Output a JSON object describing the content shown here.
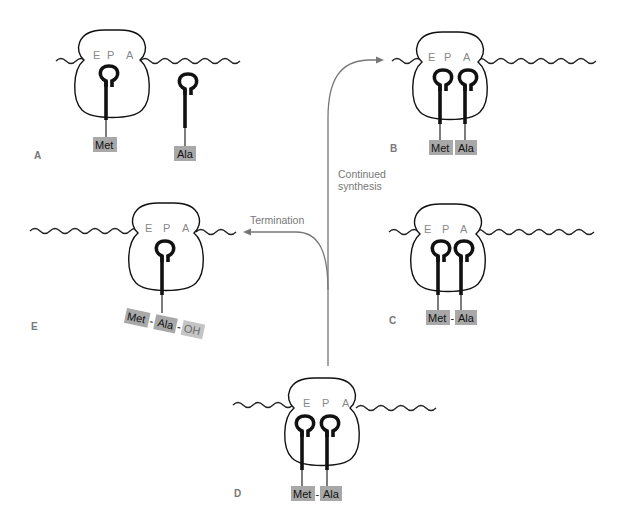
{
  "diagram": {
    "topic": "Translation elongation and termination on the ribosome",
    "site_labels": [
      "E",
      "P",
      "A"
    ],
    "panels": [
      {
        "id": "A",
        "label": "A",
        "amino_acids": [
          "Met",
          "Ala"
        ],
        "description": "Met-tRNA in P site; Ala-tRNA free"
      },
      {
        "id": "B",
        "label": "B",
        "amino_acids": [
          "Met",
          "Ala"
        ],
        "description": "Met-tRNA in P site; Ala-tRNA in A site"
      },
      {
        "id": "C",
        "label": "C",
        "amino_acids": [
          "Met",
          "Ala"
        ],
        "bond": "-",
        "description": "Peptide bond formed Met-Ala"
      },
      {
        "id": "D",
        "label": "D",
        "amino_acids": [
          "Met",
          "Ala"
        ],
        "bond": "-",
        "description": "Translocation: tRNAs in E and P sites"
      },
      {
        "id": "E",
        "label": "E",
        "amino_acids": [
          "Met",
          "Ala",
          "OH"
        ],
        "bond": "-",
        "description": "Released peptide Met-Ala-OH"
      }
    ],
    "arrows": [
      {
        "label": "Continued synthesis",
        "label_line1": "Continued",
        "label_line2": "synthesis",
        "from": "D",
        "to": "B"
      },
      {
        "label": "Termination",
        "from": "D",
        "to": "E"
      }
    ]
  }
}
